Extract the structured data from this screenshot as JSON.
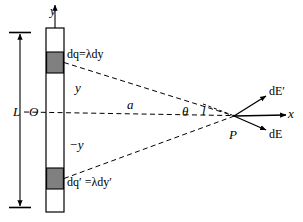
{
  "figure": {
    "type": "physics-vector-diagram",
    "colors": {
      "stroke": "#000000",
      "background": "#ffffff",
      "charge_element_fill": "#808080",
      "rod_fill": "#ffffff"
    }
  },
  "labels": {
    "y_axis": "y",
    "x_axis": "x",
    "origin": "O",
    "rod_length": "L",
    "distance_a": "a",
    "distance_l": "l",
    "angle_theta": "θ",
    "point_P": "P",
    "y_positive": "y",
    "y_negative": "−y",
    "charge_element_top": "dq=λdy",
    "charge_element_bottom": "dq′ =λdy′",
    "field_top": "dE′",
    "field_bottom": "dE"
  },
  "geometry": {
    "rod": {
      "x_left": 46,
      "x_right": 64,
      "y_top": 28,
      "y_bottom": 212,
      "width": 18,
      "height": 184
    },
    "charge_top": {
      "x": 46,
      "y": 52,
      "width": 18,
      "height": 21
    },
    "charge_bottom": {
      "x": 46,
      "y": 168,
      "width": 18,
      "height": 21
    },
    "origin": {
      "x": 55,
      "y": 112
    },
    "point_P": {
      "x": 233,
      "y": 116
    },
    "y_axis_arrow_tip": {
      "x": 55,
      "y": 4
    },
    "x_axis_arrow_tip": {
      "x": 288,
      "y": 115
    },
    "L_bracket": {
      "x": 20,
      "y_top": 33,
      "y_bottom": 207
    }
  },
  "vectors": [
    {
      "name": "dE-prime",
      "label": "dE′",
      "from": [
        233,
        116
      ],
      "to": [
        268,
        95
      ]
    },
    {
      "name": "x-axis",
      "label": "x",
      "from": [
        233,
        116
      ],
      "to": [
        288,
        115
      ]
    },
    {
      "name": "dE",
      "label": "dE",
      "from": [
        233,
        116
      ],
      "to": [
        268,
        131
      ]
    }
  ],
  "dashed_lines": [
    {
      "name": "a-axis-line",
      "from": [
        24,
        112
      ],
      "to": [
        233,
        116
      ]
    },
    {
      "name": "ray-top",
      "from": [
        64,
        62
      ],
      "to": [
        233,
        116
      ]
    },
    {
      "name": "ray-bottom",
      "from": [
        64,
        179
      ],
      "to": [
        233,
        116
      ]
    },
    {
      "name": "theta-reference",
      "from": [
        200,
        103
      ],
      "to": [
        233,
        116
      ]
    }
  ]
}
